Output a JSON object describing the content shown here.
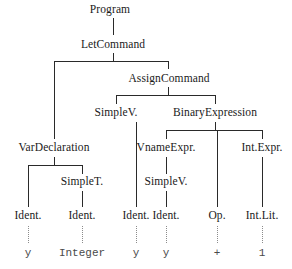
{
  "figure": {
    "kind": "abstract-syntax-tree",
    "width": 292,
    "height": 269,
    "background_color": "#ffffff",
    "node_text_color": "#1a1a1a",
    "terminal_text_color": "#4a4a4a",
    "edge_color": "#2a2a2a",
    "dotted_edge_color": "#8c8c8c"
  },
  "nodes": {
    "program": "Program",
    "let_command": "LetCommand",
    "assign_command": "AssignCommand",
    "simple_v_lhs": "SimpleV.",
    "binary_expression": "BinaryExpression",
    "var_declaration": "VarDeclaration",
    "vname_expr": "VnameExpr.",
    "int_expr": "Int.Expr.",
    "simple_t": "SimpleT.",
    "simple_v_rhs": "SimpleV.",
    "ident_1": "Ident.",
    "ident_2": "Ident.",
    "ident_3": "Ident.",
    "ident_4": "Ident.",
    "op": "Op.",
    "int_lit": "Int.Lit."
  },
  "terminals": {
    "t1": "y",
    "t2": "Integer",
    "t3": "y",
    "t4": "y",
    "t5": "+",
    "t6": "1"
  }
}
